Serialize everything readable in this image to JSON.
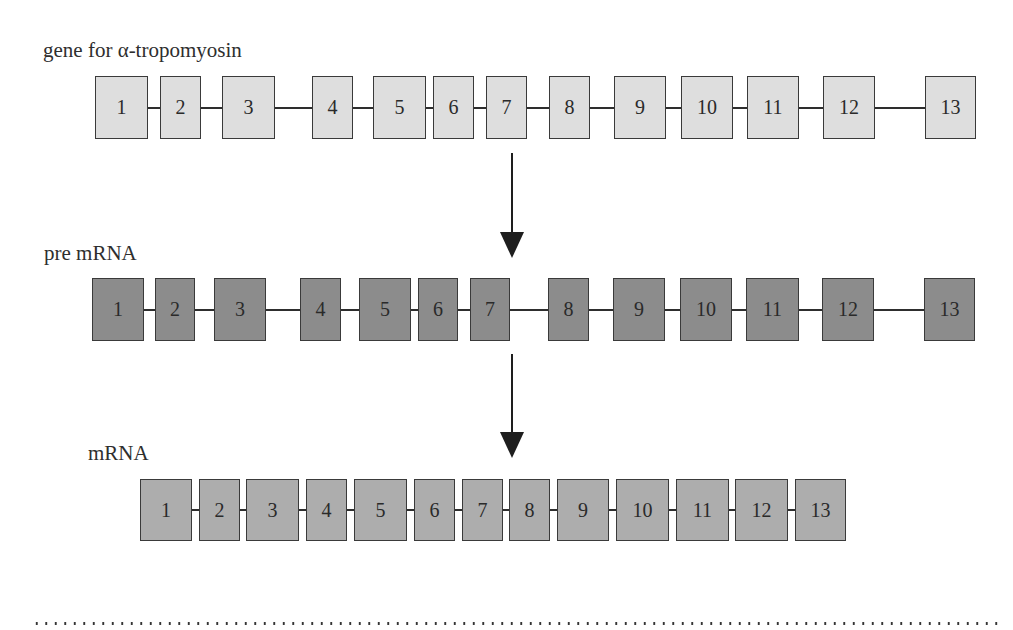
{
  "labels": {
    "gene": "gene for α-tropomyosin",
    "pre_mrna": "pre mRNA",
    "mrna": "mRNA"
  },
  "colors": {
    "gene_fill": "#dedede",
    "pre_mrna_fill": "#8c8c8c",
    "mrna_fill": "#adadad",
    "outline": "#3a3a3a"
  },
  "rows": {
    "gene": {
      "top": 76,
      "height": 63,
      "exons": [
        {
          "label": "1",
          "x": 95,
          "w": 53
        },
        {
          "label": "2",
          "x": 160,
          "w": 41
        },
        {
          "label": "3",
          "x": 222,
          "w": 53
        },
        {
          "label": "4",
          "x": 312,
          "w": 41
        },
        {
          "label": "5",
          "x": 373,
          "w": 53
        },
        {
          "label": "6",
          "x": 433,
          "w": 41
        },
        {
          "label": "7",
          "x": 486,
          "w": 41
        },
        {
          "label": "8",
          "x": 549,
          "w": 41
        },
        {
          "label": "9",
          "x": 614,
          "w": 52
        },
        {
          "label": "10",
          "x": 681,
          "w": 52
        },
        {
          "label": "11",
          "x": 747,
          "w": 52
        },
        {
          "label": "12",
          "x": 823,
          "w": 52
        },
        {
          "label": "13",
          "x": 925,
          "w": 51
        }
      ]
    },
    "pre_mrna": {
      "top": 278,
      "height": 63,
      "exons": [
        {
          "label": "1",
          "x": 92,
          "w": 52
        },
        {
          "label": "2",
          "x": 155,
          "w": 40
        },
        {
          "label": "3",
          "x": 214,
          "w": 52
        },
        {
          "label": "4",
          "x": 300,
          "w": 41
        },
        {
          "label": "5",
          "x": 359,
          "w": 52
        },
        {
          "label": "6",
          "x": 418,
          "w": 40
        },
        {
          "label": "7",
          "x": 470,
          "w": 40
        },
        {
          "label": "8",
          "x": 548,
          "w": 41
        },
        {
          "label": "9",
          "x": 613,
          "w": 52
        },
        {
          "label": "10",
          "x": 680,
          "w": 52
        },
        {
          "label": "11",
          "x": 746,
          "w": 53
        },
        {
          "label": "12",
          "x": 822,
          "w": 52
        },
        {
          "label": "13",
          "x": 924,
          "w": 51
        }
      ]
    },
    "mrna": {
      "top": 479,
      "height": 62,
      "exons": [
        {
          "label": "1",
          "x": 140,
          "w": 52
        },
        {
          "label": "2",
          "x": 199,
          "w": 41
        },
        {
          "label": "3",
          "x": 246,
          "w": 53
        },
        {
          "label": "4",
          "x": 306,
          "w": 41
        },
        {
          "label": "5",
          "x": 354,
          "w": 53
        },
        {
          "label": "6",
          "x": 414,
          "w": 41
        },
        {
          "label": "7",
          "x": 462,
          "w": 41
        },
        {
          "label": "8",
          "x": 509,
          "w": 41
        },
        {
          "label": "9",
          "x": 557,
          "w": 52
        },
        {
          "label": "10",
          "x": 616,
          "w": 53
        },
        {
          "label": "11",
          "x": 676,
          "w": 53
        },
        {
          "label": "12",
          "x": 735,
          "w": 53
        },
        {
          "label": "13",
          "x": 795,
          "w": 51
        }
      ]
    }
  },
  "arrows": [
    {
      "name": "transcription-arrow",
      "x": 500,
      "top": 153,
      "bottom": 258
    },
    {
      "name": "splicing-arrow",
      "x": 500,
      "top": 354,
      "bottom": 458
    }
  ]
}
